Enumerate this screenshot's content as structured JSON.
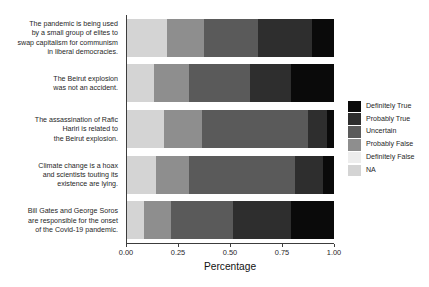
{
  "chart_data": {
    "type": "bar",
    "subtype": "horizontal-stacked-100-percent",
    "title": "",
    "xlabel": "Percentage",
    "ylabel": "",
    "xlim": [
      0,
      1
    ],
    "xticks": [
      "0.00",
      "0.25",
      "0.50",
      "0.75",
      "1.00"
    ],
    "xtick_values": [
      0,
      0.25,
      0.5,
      0.75,
      1
    ],
    "grid": false,
    "legend_position": "right",
    "stack_order_left_to_right": [
      "NA",
      "Definitely False",
      "Probably False",
      "Uncertain",
      "Probably True",
      "Definitely True"
    ],
    "categories": [
      "The pandemic is being used by a small group of elites to swap capitalism for communism in liberal democracies.",
      "The Beirut explosion was not an accident.",
      "The assassination of Rafic Hariri is related to the Beirut explosion.",
      "Climate change is a hoax and scientists touting its existence are lying.",
      "Bill Gates and George Soros are responsible for the onset of the Covid-19 pandemic."
    ],
    "category_lines": [
      [
        "The pandemic is being used",
        "by a small group of elites to",
        "swap capitalism for communism",
        "in liberal democracies."
      ],
      [
        "The Beirut explosion",
        "was not an accident."
      ],
      [
        "The assassination of Rafic",
        "Hariri is related to",
        "the Beirut explosion."
      ],
      [
        "Climate change is a hoax",
        "and scientists touting its",
        "existence are lying."
      ],
      [
        "Bill Gates and George Soros",
        "are responsible for the onset",
        "of the Covid-19 pandemic."
      ]
    ],
    "series": [
      {
        "name": "NA",
        "color": "#d4d4d4",
        "values": [
          0.19,
          0.13,
          0.18,
          0.14,
          0.08
        ]
      },
      {
        "name": "Definitely False",
        "color": "#ededed",
        "values": [
          0.0,
          0.0,
          0.0,
          0.0,
          0.0
        ]
      },
      {
        "name": "Probably False",
        "color": "#8e8e8e",
        "values": [
          0.18,
          0.17,
          0.18,
          0.16,
          0.13
        ]
      },
      {
        "name": "Uncertain",
        "color": "#5a5a5a",
        "values": [
          0.26,
          0.29,
          0.51,
          0.51,
          0.3
        ]
      },
      {
        "name": "Probably True",
        "color": "#2e2e2e",
        "values": [
          0.26,
          0.2,
          0.09,
          0.13,
          0.28
        ]
      },
      {
        "name": "Definitely True",
        "color": "#0a0a0a",
        "values": [
          0.11,
          0.21,
          0.04,
          0.06,
          0.21
        ]
      }
    ]
  },
  "legend": {
    "items": [
      {
        "label": "Definitely True",
        "color": "#0a0a0a"
      },
      {
        "label": "Probably True",
        "color": "#2e2e2e"
      },
      {
        "label": "Uncertain",
        "color": "#5a5a5a"
      },
      {
        "label": "Probably False",
        "color": "#8e8e8e"
      },
      {
        "label": "Definitely False",
        "color": "#ededed"
      },
      {
        "label": "NA",
        "color": "#d4d4d4"
      }
    ]
  },
  "axis": {
    "x_title": "Percentage"
  }
}
